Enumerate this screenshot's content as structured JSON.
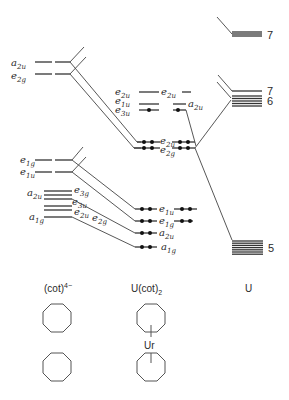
{
  "columns": {
    "left": {
      "label": "(cot)",
      "superscript": "4−"
    },
    "center": {
      "label": "U(cot)",
      "subscript": "2"
    },
    "right": {
      "label": "U"
    }
  },
  "metal_label": "Ur",
  "left_levels": [
    {
      "name": "a2u",
      "base": "a",
      "sub": "2u",
      "y": 62,
      "dashed": true
    },
    {
      "name": "e2g",
      "base": "e",
      "sub": "2g",
      "y": 74,
      "dashed": true
    },
    {
      "name": "e1g",
      "base": "e",
      "sub": "1g",
      "y": 160,
      "dashed": true
    },
    {
      "name": "e1u",
      "base": "e",
      "sub": "1u",
      "y": 172,
      "dashed": true
    },
    {
      "name": "a2u-block",
      "base": "a",
      "sub": "2u",
      "y": 196,
      "dashed": false
    },
    {
      "name": "a1g",
      "base": "a",
      "sub": "1g",
      "y": 220,
      "dashed": false
    }
  ],
  "left_block_labels": [
    {
      "base": "e",
      "sub": "3g",
      "x": 74,
      "y": 194
    },
    {
      "base": "e",
      "sub": "3u",
      "x": 72,
      "y": 206
    },
    {
      "base": "e",
      "sub": "2u",
      "x": 74,
      "y": 216
    },
    {
      "base": "e",
      "sub": "2g",
      "x": 92,
      "y": 222
    }
  ],
  "center_levels": [
    {
      "name": "e2u-upper",
      "base": "e",
      "sub": "2u",
      "y": 92,
      "electrons_left": 0,
      "electrons_right": 0
    },
    {
      "name": "e1u-upper",
      "base": "e",
      "sub": "1u",
      "y": 104,
      "electrons_left": 0,
      "electrons_right": 0
    },
    {
      "name": "e3u",
      "base": "e",
      "sub": "3u",
      "y": 110,
      "electrons_left": 1,
      "electrons_right": 0
    },
    {
      "name": "a2u-upper",
      "base": "a",
      "sub": "2u",
      "y": 110,
      "electrons_left": 0,
      "electrons_right": 1
    },
    {
      "name": "e2u",
      "base": "e",
      "sub": "2u",
      "y": 142,
      "electrons_left": 2,
      "electrons_right": 2
    },
    {
      "name": "e2g",
      "base": "e",
      "sub": "2g",
      "y": 148,
      "electrons_left": 2,
      "electrons_right": 2
    },
    {
      "name": "e1u",
      "base": "e",
      "sub": "1u",
      "y": 209,
      "electrons_left": 2,
      "electrons_right": 2
    },
    {
      "name": "e1g",
      "base": "e",
      "sub": "1g",
      "y": 221,
      "electrons_left": 2,
      "electrons_right": 2
    },
    {
      "name": "a2u",
      "base": "a",
      "sub": "2u",
      "y": 233,
      "electrons_left": 2,
      "electrons_right": 0
    },
    {
      "name": "a1g",
      "base": "a",
      "sub": "1g",
      "y": 247,
      "electrons_left": 2,
      "electrons_right": 0
    }
  ],
  "right_levels": [
    {
      "name": "7p",
      "number": "7",
      "y": 34
    },
    {
      "name": "7s",
      "number": "7",
      "y": 91
    },
    {
      "name": "6d",
      "number": "6",
      "y": 100
    },
    {
      "name": "5f",
      "number": "5",
      "y": 248
    }
  ]
}
